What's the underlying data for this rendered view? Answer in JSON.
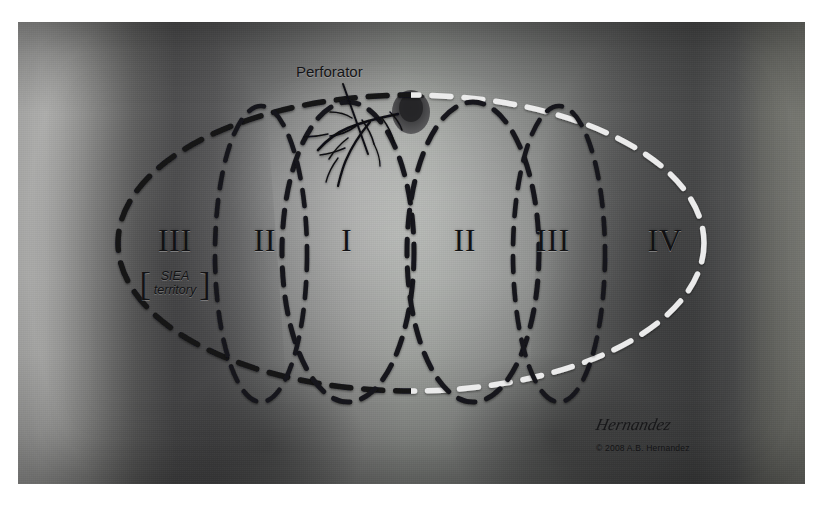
{
  "figure": {
    "kind": "medical-illustration",
    "background_color": "#ffffff",
    "plate_tone": "grayscale-photograph"
  },
  "annotations": {
    "perforator_label": "Perforator",
    "siea_line1": "SIEA",
    "siea_line2": "territory",
    "bracket_left": "[",
    "bracket_right": "]",
    "signature": "Hernandez",
    "copyright": "© 2008 A.B. Hernandez"
  },
  "zones": [
    {
      "id": "zone-3-left",
      "label": "III",
      "x": 175,
      "y": 241
    },
    {
      "id": "zone-2-left",
      "label": "II",
      "x": 265,
      "y": 241
    },
    {
      "id": "zone-1",
      "label": "I",
      "x": 347,
      "y": 241
    },
    {
      "id": "zone-2-right",
      "label": "II",
      "x": 465,
      "y": 241
    },
    {
      "id": "zone-3-right",
      "label": "III",
      "x": 553,
      "y": 241
    },
    {
      "id": "zone-4-right",
      "label": "IV",
      "x": 665,
      "y": 241
    }
  ],
  "graphics": {
    "outer_ellipse": {
      "name": "flap-outline-ellipse",
      "cx": 411,
      "cy": 243,
      "rx": 293,
      "ry": 148,
      "dash_dark_color": "#15151a",
      "dash_light_color": "#ececec",
      "dash_pattern": "18 13",
      "stroke_width": 5
    },
    "inner_ovals": [
      {
        "name": "midline-oval-left",
        "cx": 344,
        "cy": 250,
        "rx": 78,
        "ry": 155,
        "color": "#18181c"
      },
      {
        "name": "midline-oval-right",
        "cx": 470,
        "cy": 250,
        "rx": 78,
        "ry": 155,
        "color": "#18181c"
      },
      {
        "name": "zone-divider-left",
        "cx": 262,
        "cy": 250,
        "rx": 52,
        "ry": 152,
        "color": "#18181c"
      },
      {
        "name": "zone-divider-right",
        "cx": 556,
        "cy": 250,
        "rx": 52,
        "ry": 152,
        "color": "#18181c"
      }
    ],
    "vertical_dotted_lines": [
      {
        "name": "dotted-line-left",
        "x": 274,
        "color": "#f2f2f2"
      },
      {
        "name": "dotted-line-middle",
        "x": 411,
        "color": "#f2f2f2"
      },
      {
        "name": "dotted-line-right",
        "x": 553,
        "color": "#f2f2f2"
      }
    ],
    "umbilicus": {
      "name": "umbilicus",
      "cx": 411,
      "cy": 110,
      "rx": 17,
      "ry": 20
    },
    "leader_line": {
      "name": "perforator-leader",
      "x1": 343,
      "y1": 84,
      "x2": 368,
      "y2": 148
    },
    "vessel_color": "#101014"
  }
}
